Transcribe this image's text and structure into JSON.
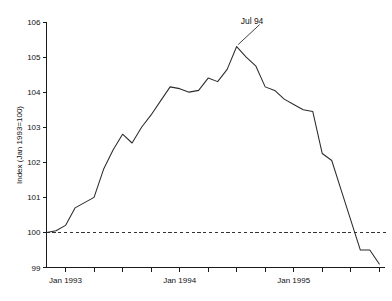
{
  "chart_data": {
    "type": "line",
    "title": "",
    "xlabel": "",
    "ylabel": "Index (Jan 1993=100)",
    "ylim": [
      99,
      106
    ],
    "ytick_labels": [
      "99",
      "100",
      "101",
      "102",
      "103",
      "104",
      "105",
      "106"
    ],
    "ytick_values": [
      99,
      100,
      101,
      102,
      103,
      104,
      105,
      106
    ],
    "xtick_labels": [
      "Jan 1993",
      "Jan 1994",
      "Jan 1995"
    ],
    "xtick_label_positions": [
      2,
      14,
      26
    ],
    "xtick_count": 12,
    "grid": false,
    "legend": "none",
    "line_color": "#2b2b2b",
    "reference_line": {
      "value": 100,
      "style": "dashed",
      "color": "#333333"
    },
    "annotations": [
      {
        "text": "Jul 94",
        "points_to_x": 20,
        "points_to_y": 105.3
      }
    ],
    "x": [
      0,
      1,
      2,
      3,
      4,
      5,
      6,
      7,
      8,
      9,
      10,
      11,
      12,
      13,
      14,
      15,
      16,
      17,
      18,
      19,
      20,
      21,
      22,
      23,
      24,
      25,
      26,
      27,
      28,
      29,
      30,
      31,
      32,
      33,
      34,
      35
    ],
    "x_month_labels": [
      "Nov 1992",
      "Dec 1992",
      "Jan 1993",
      "Feb 1993",
      "Mar 1993",
      "Apr 1993",
      "May 1993",
      "Jun 1993",
      "Jul 1993",
      "Aug 1993",
      "Sep 1993",
      "Oct 1993",
      "Nov 1993",
      "Dec 1993",
      "Jan 1994",
      "Feb 1994",
      "Mar 1994",
      "Apr 1994",
      "May 1994",
      "Jun 1994",
      "Jul 1994",
      "Aug 1994",
      "Sep 1994",
      "Oct 1994",
      "Nov 1994",
      "Dec 1994",
      "Jan 1995",
      "Feb 1995",
      "Mar 1995",
      "Apr 1995",
      "May 1995",
      "Jun 1995",
      "Jul 1995",
      "Aug 1995",
      "Sep 1995",
      "Oct 1995"
    ],
    "values": [
      100.0,
      100.05,
      100.2,
      100.7,
      100.85,
      101.0,
      101.8,
      102.35,
      102.8,
      102.55,
      103.0,
      103.35,
      103.75,
      104.15,
      104.1,
      104.0,
      104.05,
      104.4,
      104.3,
      104.65,
      105.3,
      105.0,
      104.75,
      104.15,
      104.05,
      103.8,
      103.65,
      103.5,
      103.45,
      102.25,
      102.05,
      101.2,
      100.35,
      99.5,
      99.5,
      99.1
    ],
    "peak": {
      "label": "Jul 94",
      "value": 105.3
    },
    "start_value": 100.0,
    "end_value": 99.1
  }
}
